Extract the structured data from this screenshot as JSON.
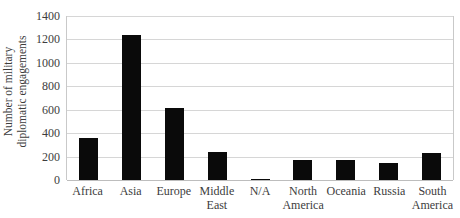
{
  "chart_data": {
    "type": "bar",
    "title": "",
    "xlabel": "",
    "ylabel": "Number of military diplomatic engagements",
    "ylabel_lines": [
      "Number of military",
      "diplomatic engagements"
    ],
    "categories": [
      "Africa",
      "Asia",
      "Europe",
      "Middle East",
      "N/A",
      "North America",
      "Oceania",
      "Russia",
      "South America"
    ],
    "category_lines": [
      [
        "Africa"
      ],
      [
        "Asia"
      ],
      [
        "Europe"
      ],
      [
        "Middle",
        "East"
      ],
      [
        "N/A"
      ],
      [
        "North",
        "America"
      ],
      [
        "Oceania"
      ],
      [
        "Russia"
      ],
      [
        "South",
        "America"
      ]
    ],
    "values": [
      355,
      1240,
      615,
      235,
      10,
      175,
      175,
      145,
      230
    ],
    "ylim": [
      0,
      1400
    ],
    "yticks": [
      0,
      200,
      400,
      600,
      800,
      1000,
      1200,
      1400
    ],
    "ytick_labels": [
      "0",
      "200",
      "400",
      "600",
      "800",
      "1000",
      "1200",
      "1400"
    ],
    "grid": true,
    "legend": false,
    "bar_color": "#0a0a0a",
    "gridline_color": "#d6d6d6",
    "axis_border_color": "#c9c9c9",
    "background_color": "#ffffff",
    "text_color": "#3d3d3d"
  }
}
